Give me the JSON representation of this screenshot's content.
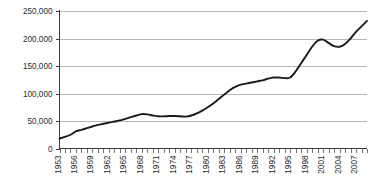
{
  "chart_data": {
    "type": "line",
    "title": "",
    "subtitle": "",
    "xlabel": "",
    "ylabel": "",
    "grid": true,
    "legend": "none",
    "ylim": [
      0,
      250000
    ],
    "xlim": [
      1953,
      2009
    ],
    "y_ticks": [
      0,
      50000,
      100000,
      150000,
      200000,
      250000
    ],
    "y_tick_labels": [
      "0",
      "50,000",
      "100,000",
      "150,000",
      "200,000",
      "250,000"
    ],
    "x_tick_labels": [
      "1953",
      "1956",
      "1959",
      "1962",
      "1965",
      "1968",
      "1971",
      "1974",
      "1977",
      "1980",
      "1983",
      "1986",
      "1989",
      "1992",
      "1995",
      "1998",
      "2001",
      "2004",
      "2007"
    ],
    "x_tick_label_interval": 3,
    "x_minor_tick_years": [
      1953,
      1954,
      1955,
      1956,
      1957,
      1958,
      1959,
      1960,
      1961,
      1962,
      1963,
      1964,
      1965,
      1966,
      1967,
      1968,
      1969,
      1970,
      1971,
      1972,
      1973,
      1974,
      1975,
      1976,
      1977,
      1978,
      1979,
      1980,
      1981,
      1982,
      1983,
      1984,
      1985,
      1986,
      1987,
      1988,
      1989,
      1990,
      1991,
      1992,
      1993,
      1994,
      1995,
      1996,
      1997,
      1998,
      1999,
      2000,
      2001,
      2002,
      2003,
      2004,
      2005,
      2006,
      2007,
      2008,
      2009
    ],
    "series": [
      {
        "name": "series-1",
        "color": "#1a1a1a",
        "x": [
          1953,
          1954,
          1955,
          1956,
          1957,
          1958,
          1959,
          1960,
          1961,
          1962,
          1963,
          1964,
          1965,
          1966,
          1967,
          1968,
          1969,
          1970,
          1971,
          1972,
          1973,
          1974,
          1975,
          1976,
          1977,
          1978,
          1979,
          1980,
          1981,
          1982,
          1983,
          1984,
          1985,
          1986,
          1987,
          1988,
          1989,
          1990,
          1991,
          1992,
          1993,
          1994,
          1995,
          1996,
          1997,
          1998,
          1999,
          2000,
          2001,
          2002,
          2003,
          2004,
          2005,
          2006,
          2007,
          2008,
          2009
        ],
        "values": [
          18000,
          21000,
          25000,
          31000,
          34000,
          37000,
          40000,
          43000,
          45000,
          47000,
          49000,
          51000,
          54000,
          57000,
          60000,
          62500,
          62000,
          60000,
          58500,
          58500,
          59000,
          59000,
          58500,
          58000,
          60000,
          64000,
          69000,
          75000,
          82000,
          90000,
          98000,
          106000,
          112000,
          116000,
          118000,
          120000,
          122000,
          124000,
          127000,
          129000,
          129000,
          128000,
          129000,
          140000,
          155000,
          170000,
          185000,
          196000,
          198000,
          192000,
          186000,
          185000,
          190000,
          200000,
          212000,
          222000,
          232000
        ]
      }
    ]
  },
  "axis": {
    "y_axis_name": "y-axis",
    "x_axis_name": "x-axis"
  }
}
